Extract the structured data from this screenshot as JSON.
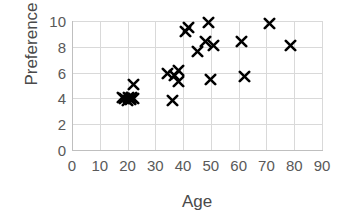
{
  "chart_data": {
    "type": "scatter",
    "title": "",
    "xlabel": "Age",
    "ylabel": "Preference",
    "xlim": [
      0,
      90
    ],
    "ylim": [
      0,
      10
    ],
    "xticks": [
      0,
      10,
      20,
      30,
      40,
      50,
      60,
      70,
      80,
      90
    ],
    "yticks": [
      0,
      2,
      4,
      6,
      8,
      10
    ],
    "grid": true,
    "legend": null,
    "marker_symbol": "x",
    "marker_color": "#000000",
    "series": [
      {
        "name": "Preference vs Age",
        "points": [
          {
            "x": 18,
            "y": 4.1
          },
          {
            "x": 19,
            "y": 4.0
          },
          {
            "x": 20,
            "y": 3.8
          },
          {
            "x": 20.5,
            "y": 4.1
          },
          {
            "x": 21,
            "y": 3.9
          },
          {
            "x": 21.5,
            "y": 4.1
          },
          {
            "x": 22,
            "y": 4.0
          },
          {
            "x": 22,
            "y": 5.1
          },
          {
            "x": 36,
            "y": 3.8
          },
          {
            "x": 34.5,
            "y": 5.9
          },
          {
            "x": 37,
            "y": 5.8
          },
          {
            "x": 38.5,
            "y": 6.2
          },
          {
            "x": 38.5,
            "y": 5.3
          },
          {
            "x": 41,
            "y": 9.2
          },
          {
            "x": 42,
            "y": 9.5
          },
          {
            "x": 45,
            "y": 7.6
          },
          {
            "x": 48,
            "y": 8.4
          },
          {
            "x": 49,
            "y": 9.9
          },
          {
            "x": 50,
            "y": 5.5
          },
          {
            "x": 51,
            "y": 8.1
          },
          {
            "x": 61,
            "y": 8.4
          },
          {
            "x": 62,
            "y": 5.7
          },
          {
            "x": 71,
            "y": 9.8
          },
          {
            "x": 78.5,
            "y": 8.1
          }
        ]
      }
    ]
  }
}
